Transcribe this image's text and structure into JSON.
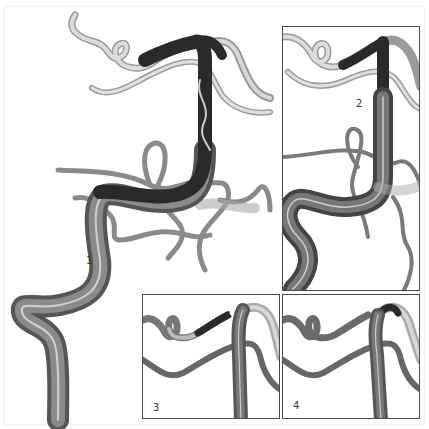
{
  "figure": {
    "steps": [
      {
        "id": 1,
        "label": "1"
      },
      {
        "id": 2,
        "label": "2"
      },
      {
        "id": 3,
        "label": "3"
      },
      {
        "id": 4,
        "label": "4"
      }
    ]
  },
  "colors": {
    "vessel_light": "#c8c8c8",
    "vessel_mid": "#8a8a8a",
    "vessel_dark": "#3a3a3a",
    "catheter": "#2a2a2a",
    "panel_border": "#4a4a4a",
    "background": "#ffffff"
  }
}
